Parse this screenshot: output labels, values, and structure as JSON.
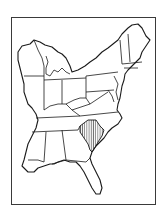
{
  "map": {
    "title": "",
    "subject": "Eastern United States",
    "highlighted_state": "South Carolina",
    "highlight_pattern": "vertical-hatch",
    "colors": {
      "outline": "#1a1a1a",
      "frame": "#3a3a3a",
      "background": "#ffffff",
      "land": "#ffffff"
    },
    "states": [
      "Wisconsin",
      "Michigan",
      "Illinois",
      "Indiana",
      "Ohio",
      "Pennsylvania",
      "New York",
      "Vermont",
      "New Hampshire",
      "Maine",
      "Massachusetts",
      "Connecticut",
      "Rhode Island",
      "New Jersey",
      "Delaware",
      "Maryland",
      "West Virginia",
      "Virginia",
      "Kentucky",
      "Tennessee",
      "North Carolina",
      "South Carolina",
      "Georgia",
      "Alabama",
      "Mississippi",
      "Florida"
    ]
  }
}
